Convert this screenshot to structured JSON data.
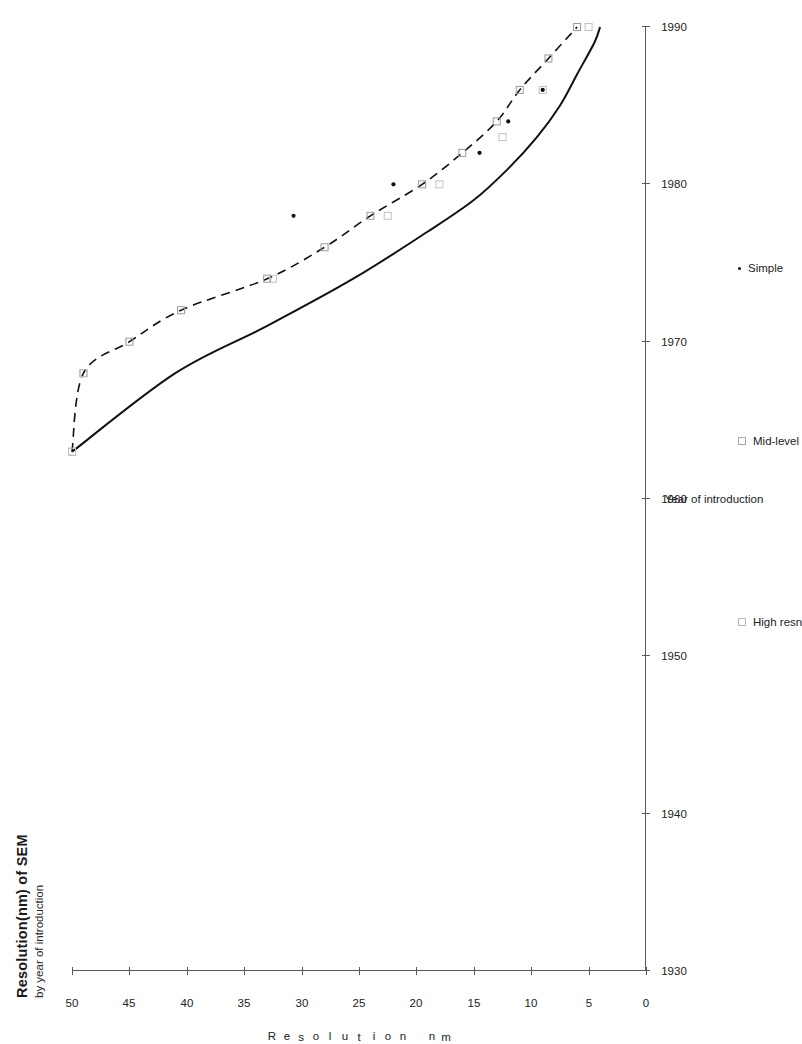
{
  "chart_data": {
    "type": "line",
    "title": "Resolution(nm) of SEM",
    "subtitle": "by year of introduction",
    "xlabel": "Year of introduction",
    "ylabel_chars": [
      "R",
      "e",
      "s",
      "o",
      "l",
      "u",
      "t",
      "i",
      "o",
      "n",
      "",
      "n",
      "m"
    ],
    "ylabel": "Resolution - nm",
    "xlim": [
      1930,
      1990
    ],
    "ylim": [
      0,
      50
    ],
    "xticks": [
      "1930",
      "1940",
      "1950",
      "1960",
      "1970",
      "1980",
      "1990"
    ],
    "yticks": [
      "0",
      "5",
      "10",
      "15",
      "20",
      "25",
      "30",
      "35",
      "40",
      "45",
      "50"
    ],
    "grid": false,
    "legend_position": "below-axis",
    "legend": [
      {
        "name": "High resn",
        "marker": "open-square-light",
        "line": "solid"
      },
      {
        "name": "Mid-level",
        "marker": "open-square",
        "line": "dashed"
      },
      {
        "name": "Simple",
        "marker": "dot",
        "line": "none"
      }
    ],
    "series": [
      {
        "name": "High resn",
        "marker": "open-square-light",
        "line": "solid",
        "points": [
          {
            "x": 1963,
            "y": 50.0
          },
          {
            "x": 1968,
            "y": 41.0
          },
          {
            "x": 1971,
            "y": 33.0
          },
          {
            "x": 1974,
            "y": 25.5
          },
          {
            "x": 1977,
            "y": 19.0
          },
          {
            "x": 1979,
            "y": 15.0
          },
          {
            "x": 1981,
            "y": 12.0
          },
          {
            "x": 1983,
            "y": 9.5
          },
          {
            "x": 1985,
            "y": 7.5
          },
          {
            "x": 1987,
            "y": 6.0
          },
          {
            "x": 1989,
            "y": 4.5
          },
          {
            "x": 1990,
            "y": 4.0
          }
        ]
      },
      {
        "name": "Mid-level",
        "marker": "open-square",
        "line": "dashed",
        "points": [
          {
            "x": 1963,
            "y": 50.0
          },
          {
            "x": 1968,
            "y": 49.0
          },
          {
            "x": 1970,
            "y": 45.0
          },
          {
            "x": 1972,
            "y": 40.5
          },
          {
            "x": 1974,
            "y": 33.0
          },
          {
            "x": 1976,
            "y": 28.0
          },
          {
            "x": 1978,
            "y": 24.0
          },
          {
            "x": 1980,
            "y": 19.5
          },
          {
            "x": 1982,
            "y": 16.0
          },
          {
            "x": 1984,
            "y": 13.0
          },
          {
            "x": 1986,
            "y": 11.0
          },
          {
            "x": 1988,
            "y": 8.5
          },
          {
            "x": 1990,
            "y": 6.0
          }
        ]
      },
      {
        "name": "Simple",
        "marker": "dot",
        "line": "none",
        "points": [
          {
            "x": 1978,
            "y": 30.7
          },
          {
            "x": 1980,
            "y": 22.0
          },
          {
            "x": 1982,
            "y": 14.5
          },
          {
            "x": 1984,
            "y": 12.0
          },
          {
            "x": 1986,
            "y": 9.0
          }
        ]
      }
    ],
    "markers_high_resn": [
      {
        "x": 1963,
        "y": 50.0
      },
      {
        "x": 1968,
        "y": 49.0
      },
      {
        "x": 1974,
        "y": 32.5
      },
      {
        "x": 1978,
        "y": 22.5
      },
      {
        "x": 1980,
        "y": 18.0
      },
      {
        "x": 1983,
        "y": 12.5
      },
      {
        "x": 1986,
        "y": 9.0
      },
      {
        "x": 1990,
        "y": 5.0
      }
    ]
  }
}
